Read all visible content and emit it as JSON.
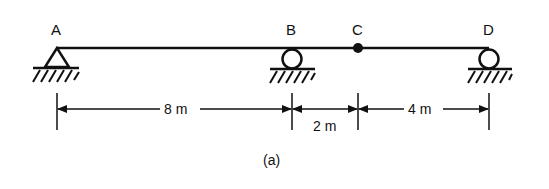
{
  "diagram": {
    "type": "beam-structure",
    "caption": "(a)",
    "colors": {
      "ink": "#111111",
      "background": "#ffffff"
    },
    "points": [
      {
        "id": "A",
        "label": "A",
        "support": "pin",
        "x": 57
      },
      {
        "id": "B",
        "label": "B",
        "support": "roller",
        "x": 292
      },
      {
        "id": "C",
        "label": "C",
        "support": "hinge",
        "x": 358
      },
      {
        "id": "D",
        "label": "D",
        "support": "roller",
        "x": 489
      }
    ],
    "dimensions": [
      {
        "from": "A",
        "to": "B",
        "label": "8 m"
      },
      {
        "from": "B",
        "to": "C",
        "label": "2 m"
      },
      {
        "from": "C",
        "to": "D",
        "label": "4 m"
      }
    ]
  }
}
